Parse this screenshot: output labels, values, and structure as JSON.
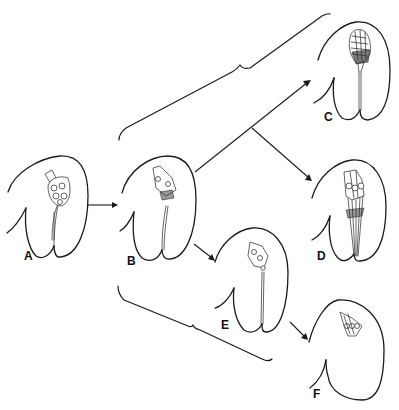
{
  "diagram": {
    "type": "developmental-stage-sequence",
    "ink_color": "#1a1a1a",
    "background": "#ffffff",
    "stages": [
      {
        "id": "A",
        "label": "A",
        "x": 58,
        "y": 238,
        "structure": "clustered cells at apex of bilobed body"
      },
      {
        "id": "B",
        "label": "B",
        "x": 160,
        "y": 258,
        "structure": "fewer cells, elongated stalk"
      },
      {
        "id": "C",
        "label": "C",
        "x": 326,
        "y": 118,
        "structure": "dense striated cap at apex"
      },
      {
        "id": "D",
        "label": "D",
        "x": 318,
        "y": 257,
        "structure": "three cells with long parallel strands"
      },
      {
        "id": "E",
        "label": "E",
        "x": 222,
        "y": 326,
        "structure": "small cell group with thin stalk"
      },
      {
        "id": "F",
        "label": "F",
        "x": 313,
        "y": 394,
        "structure": "small cell group, no stalk"
      }
    ],
    "arrows": [
      {
        "from": "A",
        "to": "B"
      },
      {
        "from": "B",
        "to": "C"
      },
      {
        "from": "B",
        "to": "D",
        "branch": "from B→C arrow midpoint"
      },
      {
        "from": "B",
        "to": "E"
      },
      {
        "from": "E",
        "to": "F"
      }
    ],
    "braces": [
      {
        "id": "upper-brace",
        "groups": [
          "C",
          "D"
        ],
        "position": "above"
      },
      {
        "id": "lower-brace",
        "groups": [
          "E",
          "F"
        ],
        "position": "below"
      }
    ]
  }
}
